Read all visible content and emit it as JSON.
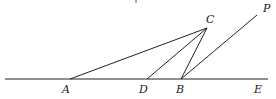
{
  "diagram": {
    "type": "geometry",
    "stroke_color": "#222222",
    "points": {
      "A": {
        "label": "A",
        "x": 70,
        "y": 79
      },
      "D": {
        "label": "D",
        "x": 147,
        "y": 79
      },
      "B": {
        "label": "B",
        "x": 181,
        "y": 79
      },
      "E": {
        "label": "E",
        "x": 262,
        "y": 79
      },
      "C": {
        "label": "C",
        "x": 207,
        "y": 28
      },
      "P": {
        "label": "P",
        "x": 257,
        "y": 15
      }
    },
    "segments": [
      {
        "from": "line-left",
        "to": "line-right",
        "name": "line-AE"
      },
      {
        "from": "A",
        "to": "C",
        "name": "segment-AC"
      },
      {
        "from": "D",
        "to": "C",
        "name": "segment-DC"
      },
      {
        "from": "B",
        "to": "C",
        "name": "segment-BC"
      },
      {
        "from": "B",
        "to": "P",
        "name": "ray-BP"
      }
    ]
  }
}
